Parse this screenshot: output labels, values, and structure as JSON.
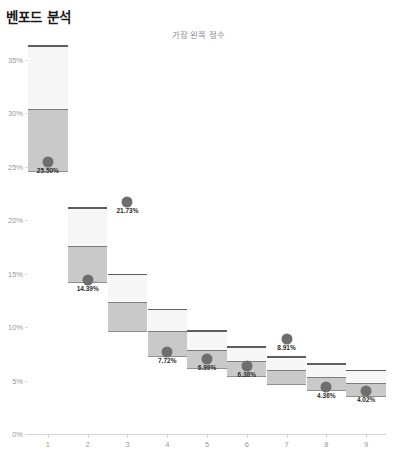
{
  "header": {
    "title": "벤포드 분석",
    "subtitle": "가장 왼쪽 정수"
  },
  "colors": {
    "box_upper": "#f7f7f7",
    "box_lower": "#c9c9c9",
    "box_cap": "#5e5e5e",
    "dot": "#6e6e6e",
    "axis": "#d4d4d4",
    "tick_text": "#9a9a9a",
    "label_text": "#2b2b2b",
    "title_text": "#1a1a1a",
    "subtitle_text": "#8c8c8c"
  },
  "chart_data": {
    "type": "bar",
    "title": "벤포드 분석",
    "subtitle": "가장 왼쪽 정수",
    "xlabel": "",
    "ylabel": "",
    "ylim": [
      0,
      36.5
    ],
    "yticks": [
      0,
      5,
      10,
      15,
      20,
      25,
      30,
      35
    ],
    "ytick_labels": [
      "0%",
      "5%",
      "10%",
      "15%",
      "20%",
      "25%",
      "30%",
      "35%"
    ],
    "grid": false,
    "legend": "none",
    "categories": [
      "1",
      "2",
      "3",
      "4",
      "5",
      "6",
      "7",
      "8",
      "9"
    ],
    "values": [
      25.5,
      14.39,
      21.73,
      7.72,
      6.99,
      6.38,
      8.91,
      4.36,
      4.02
    ],
    "value_labels": [
      "25.50%",
      "14.39%",
      "21.73%",
      "7.72%",
      "6.99%",
      "6.38%",
      "8.91%",
      "4.36%",
      "4.02%"
    ],
    "series": [
      {
        "name": "benford-expected-range",
        "boxes": [
          {
            "category": "1",
            "cap": 36.4,
            "upper_top": 36.4,
            "upper_bottom": 30.4,
            "lower_top": 30.4,
            "lower_bottom": 24.5
          },
          {
            "category": "2",
            "cap": 21.2,
            "upper_top": 21.2,
            "upper_bottom": 17.6,
            "lower_top": 17.6,
            "lower_bottom": 14.1
          },
          {
            "category": "3",
            "cap": 15.0,
            "upper_top": 15.0,
            "upper_bottom": 12.4,
            "lower_top": 12.4,
            "lower_bottom": 9.5
          },
          {
            "category": "4",
            "cap": 11.7,
            "upper_top": 11.7,
            "upper_bottom": 9.6,
            "lower_top": 9.6,
            "lower_bottom": 7.2
          },
          {
            "category": "5",
            "cap": 9.7,
            "upper_top": 9.7,
            "upper_bottom": 7.9,
            "lower_top": 7.9,
            "lower_bottom": 6.1
          },
          {
            "category": "6",
            "cap": 8.2,
            "upper_top": 8.2,
            "upper_bottom": 6.8,
            "lower_top": 6.8,
            "lower_bottom": 5.3
          },
          {
            "category": "7",
            "cap": 7.3,
            "upper_top": 7.3,
            "upper_bottom": 6.0,
            "lower_top": 6.0,
            "lower_bottom": 4.6
          },
          {
            "category": "8",
            "cap": 6.6,
            "upper_top": 6.6,
            "upper_bottom": 5.3,
            "lower_top": 5.3,
            "lower_bottom": 4.0
          },
          {
            "category": "9",
            "cap": 6.0,
            "upper_top": 6.0,
            "upper_bottom": 4.8,
            "lower_top": 4.8,
            "lower_bottom": 3.5
          }
        ]
      }
    ],
    "label_placement": [
      "inside-bottom",
      "below",
      "below",
      "below",
      "below",
      "below",
      "below",
      "below",
      "below"
    ]
  }
}
